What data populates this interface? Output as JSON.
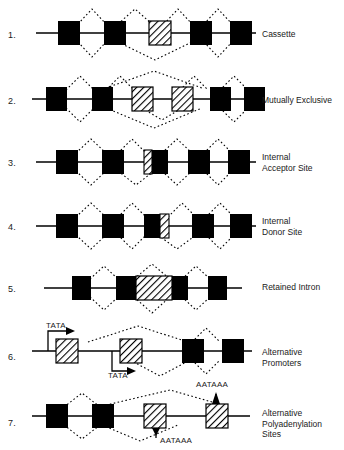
{
  "figure": {
    "background_color": "#ffffff",
    "ink_color": "#000000",
    "exon_fill": "#000000",
    "alt_exon_fill": "#ffffff",
    "alt_exon_hatch": "#000000",
    "splice_line_style": "dotted",
    "backbone_style": "solid"
  },
  "rows": [
    {
      "number": "1.",
      "label": "Cassette",
      "label_lines": [
        "Cassette"
      ],
      "exon_count": 5,
      "alt_exon_index": 2,
      "alt_exon_kind": "full-hatched",
      "splice_arcs_above": 4,
      "splice_arcs_below": 3,
      "skipping_arc": true,
      "annotations": []
    },
    {
      "number": "2.",
      "label": "Mutually Exclusive",
      "label_lines": [
        "Mutually Exclusive"
      ],
      "exon_count": 6,
      "alt_exon_index": 2,
      "alt_exon_index_2": 3,
      "alt_exon_kind": "full-hatched",
      "splice_arcs_above": 5,
      "splice_arcs_below": 4,
      "skipping_arc": true,
      "annotations": []
    },
    {
      "number": "3.",
      "label": "Internal Acceptor Site",
      "label_lines": [
        "Internal",
        "Acceptor Site"
      ],
      "exon_count": 5,
      "alt_exon_index": 2,
      "alt_exon_kind": "left-hatched",
      "splice_arcs_above": 4,
      "splice_arcs_below": 4,
      "skipping_arc": false,
      "annotations": []
    },
    {
      "number": "4.",
      "label": "Internal Donor Site",
      "label_lines": [
        "Internal",
        "Donor Site"
      ],
      "exon_count": 5,
      "alt_exon_index": 2,
      "alt_exon_kind": "right-hatched",
      "splice_arcs_above": 4,
      "splice_arcs_below": 4,
      "skipping_arc": false,
      "annotations": []
    },
    {
      "number": "5.",
      "label": "Retained Intron",
      "label_lines": [
        "Retained Intron"
      ],
      "exon_count": 4,
      "alt_exon_index": 2,
      "alt_exon_kind": "retained-block",
      "splice_arcs_above": 3,
      "splice_arcs_below": 3,
      "skipping_arc": false,
      "annotations": []
    },
    {
      "number": "6.",
      "label": "Alternative Promoters",
      "label_lines": [
        "Alternative",
        "Promoters"
      ],
      "exon_count": 4,
      "alt_exon_kind": "hatched-promoters",
      "splice_arcs_above": 2,
      "splice_arcs_below": 2,
      "skipping_arc": false,
      "annotations": [
        {
          "text": "TATA",
          "position": "above-left",
          "arrow": "up-then-right"
        },
        {
          "text": "TATA",
          "position": "below-mid",
          "arrow": "down-then-right"
        }
      ]
    },
    {
      "number": "7.",
      "label": "Alternative Polyadenylation Sites",
      "label_lines": [
        "Alternative",
        "Polyadenylation",
        "Sites"
      ],
      "exon_count": 4,
      "alt_exon_kind": "hatched-polya",
      "splice_arcs_above": 2,
      "splice_arcs_below": 1,
      "skipping_arc": true,
      "annotations": [
        {
          "text": "AATAAA",
          "position": "below-mid",
          "arrow": "down"
        },
        {
          "text": "AATAAA",
          "position": "above-right",
          "arrow": "up"
        }
      ]
    }
  ]
}
